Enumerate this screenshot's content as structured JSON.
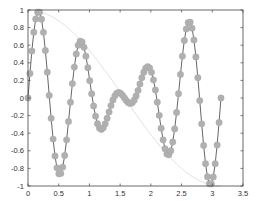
{
  "chart_data": {
    "type": "line",
    "title": "",
    "xlabel": "",
    "ylabel": "",
    "xlim": [
      0,
      3.5
    ],
    "ylim": [
      -1,
      1
    ],
    "grid": false,
    "legend": null,
    "xticks": [
      "0",
      "0.5",
      "1",
      "1.5",
      "2",
      "2.5",
      "3",
      "3.5"
    ],
    "yticks": [
      "-1",
      "-0.8",
      "-0.6",
      "-0.4",
      "-0.2",
      "0",
      "0.2",
      "0.4",
      "0.6",
      "0.8",
      "1"
    ],
    "series": [
      {
        "name": "cos(x)*sin(9x) markers",
        "style": "line with circle markers",
        "color": "#b0b0b0",
        "line_color": "#555555",
        "formula": "y = cos(x) * sin(9x)",
        "x_range": [
          0,
          3.1416
        ],
        "samples": 101,
        "key_points": [
          {
            "x": 0.0,
            "y": 0.0
          },
          {
            "x": 0.17,
            "y": 0.98
          },
          {
            "x": 0.52,
            "y": -0.87
          },
          {
            "x": 0.87,
            "y": 0.64
          },
          {
            "x": 1.22,
            "y": -0.34
          },
          {
            "x": 1.5,
            "y": 0.06
          },
          {
            "x": 1.95,
            "y": 0.35
          },
          {
            "x": 2.27,
            "y": -0.64
          },
          {
            "x": 2.62,
            "y": 0.86
          },
          {
            "x": 2.97,
            "y": -0.98
          },
          {
            "x": 3.14,
            "y": 0.0
          }
        ]
      },
      {
        "name": "cos(x) envelope",
        "style": "thin light line",
        "color": "#d8d8d8",
        "formula": "y = cos(x)",
        "x_range": [
          0,
          3.1416
        ],
        "key_points": [
          {
            "x": 0.0,
            "y": 1.0
          },
          {
            "x": 1.57,
            "y": 0.0
          },
          {
            "x": 3.14,
            "y": -1.0
          }
        ]
      }
    ]
  }
}
